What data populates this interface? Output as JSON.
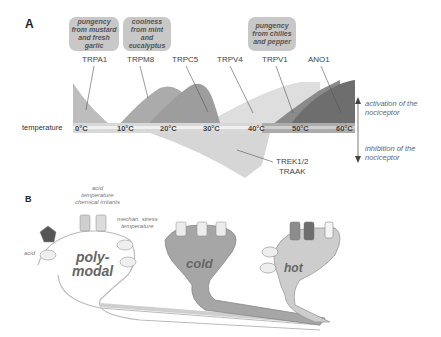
{
  "panel_a": {
    "letter": "A",
    "stimulus_boxes": [
      {
        "text": "pungency from mustard and fresh garlic"
      },
      {
        "text": "coolness from mint and eucalyptus"
      },
      {
        "text": "pungency from chilies and pepper"
      }
    ],
    "channels": [
      "TRPA1",
      "TRPM8",
      "TRPC5",
      "TRPV4",
      "TRPV1",
      "ANO1"
    ],
    "axis_label": "temperature",
    "temperature_ticks": [
      "0°C",
      "10°C",
      "20°C",
      "30°C",
      "40°C",
      "50°C",
      "60°C"
    ],
    "inhibitory_channel": "TREK1/2\nTRAAK",
    "inhibitory_channel_line1": "TREK1/2",
    "inhibitory_channel_line2": "TRAAK",
    "activation_note": "activation of the nociceptor",
    "activation_line1": "activation of the",
    "activation_line2": "nociceptor",
    "inhibition_line1": "inhibition of the",
    "inhibition_line2": "nociceptor"
  },
  "panel_b": {
    "letter": "B",
    "stimuli_top_line1": "acid",
    "stimuli_top_line2": "temperature",
    "stimuli_top_line3": "chemical irritants",
    "mech_line1": "mechan. stress",
    "mech_line2": "temperature",
    "acid_label": "acid",
    "neurons": {
      "polymodal_line1": "poly-",
      "polymodal_line2": "modal",
      "cold": "cold",
      "hot": "hot"
    },
    "ion_labels": [
      "Na⁺",
      "Ca²⁺",
      "K⁺",
      "Cl⁻"
    ]
  },
  "colors": {
    "stim_box": "#c8c8c8",
    "trpa1": "#b8b8b8",
    "trpm8": "#a8a8a8",
    "trpc5": "#9a9a9a",
    "trpv4": "#dcdcdc",
    "trpv1": "#8c8c8c",
    "ano1": "#6e6e6e",
    "trek": "#d6d6d6",
    "temperature_bar": "#cfcfcf"
  }
}
